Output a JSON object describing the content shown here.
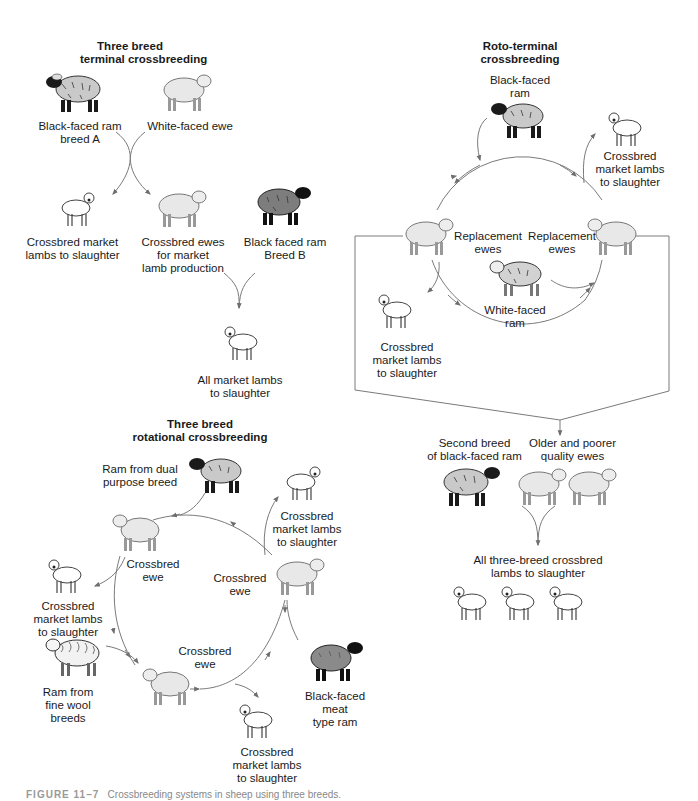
{
  "diagram": {
    "colors": {
      "line": "#6e6e6e",
      "white_ewe": "#e8e8e8",
      "black_ram_wool": "#c9c9c9",
      "dark_ram_wool": "#7d7d7d",
      "lamb": "#ffffff",
      "text": "#1a1a1a"
    },
    "terminal": {
      "title": [
        "Three breed",
        "terminal crossbreeding"
      ],
      "ram_a": [
        "Black-faced ram",
        "breed A"
      ],
      "ewe": [
        "White-faced ewe"
      ],
      "lambs": [
        "Crossbred market",
        "lambs to slaughter"
      ],
      "crossbred_ewes": [
        "Crossbred ewes",
        "for market",
        "lamb production"
      ],
      "ram_b": [
        "Black faced ram",
        "Breed B"
      ],
      "all_lambs": [
        "All market lambs",
        "to slaughter"
      ]
    },
    "roto": {
      "title": [
        "Roto-terminal",
        "crossbreeding"
      ],
      "ram": [
        "Black-faced",
        "ram"
      ],
      "lambs_top": [
        "Crossbred",
        "market lambs",
        "to slaughter"
      ],
      "repl_left": [
        "Replacement",
        "ewes"
      ],
      "repl_right": [
        "Replacement",
        "ewes"
      ],
      "white_ram": [
        "White-faced",
        "ram"
      ],
      "lambs_left": [
        "Crossbred",
        "market lambs",
        "to slaughter"
      ],
      "second_ram": [
        "Second breed",
        "of black-faced ram"
      ],
      "older_ewes": [
        "Older and poorer",
        "quality ewes"
      ],
      "all_lambs": [
        "All three-breed crossbred",
        "lambs to slaughter"
      ]
    },
    "rotational": {
      "title": [
        "Three breed",
        "rotational crossbreeding"
      ],
      "ram_dual": [
        "Ram from dual",
        "purpose breed"
      ],
      "lambs_top_right": [
        "Crossbred",
        "market lambs",
        "to slaughter"
      ],
      "ewe_left": [
        "Crossbred",
        "ewe"
      ],
      "ewe_right": [
        "Crossbred",
        "ewe"
      ],
      "lambs_left": [
        "Crossbred",
        "market lambs",
        "to slaughter"
      ],
      "ram_fine_wool": [
        "Ram from",
        "fine wool",
        "breeds"
      ],
      "ewe_bottom": [
        "Crossbred",
        "ewe"
      ],
      "ram_meat": [
        "Black-faced",
        "meat",
        "type ram"
      ],
      "lambs_bottom": [
        "Crossbred",
        "market lambs",
        "to slaughter"
      ]
    },
    "caption": {
      "figure_label": "FIGURE 11–7",
      "text": "Crossbreeding systems in sheep using three breeds."
    }
  }
}
